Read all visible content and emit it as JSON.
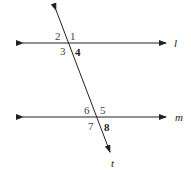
{
  "diagram": {
    "lines": {
      "l": {
        "label": "l"
      },
      "m": {
        "label": "m"
      },
      "t": {
        "label": "t"
      }
    },
    "angles_at_l": {
      "a2": "2",
      "a1": "1",
      "a3": "3",
      "a4": "4"
    },
    "angles_at_m": {
      "a6": "6",
      "a5": "5",
      "a7": "7",
      "a8": "8"
    },
    "colors": {
      "line": "#222222",
      "label": "#444444"
    }
  }
}
